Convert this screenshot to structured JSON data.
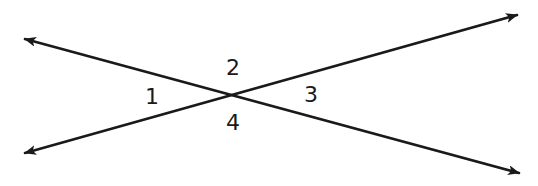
{
  "diagram": {
    "type": "intersecting-lines",
    "colors": {
      "background": "#ffffff",
      "stroke": "#1a1a1a"
    },
    "intersection": {
      "x": 233,
      "y": 94
    },
    "lines": [
      {
        "id": "line-a",
        "description": "upper-left to lower-right",
        "start": {
          "x": 25,
          "y": 39
        },
        "end": {
          "x": 519,
          "y": 173
        },
        "arrows": [
          "start",
          "end"
        ]
      },
      {
        "id": "line-b",
        "description": "lower-left to upper-right",
        "start": {
          "x": 25,
          "y": 153
        },
        "end": {
          "x": 517,
          "y": 15
        },
        "arrows": [
          "start",
          "end"
        ]
      }
    ],
    "angles": [
      {
        "label": "1",
        "position": "left",
        "x": 152,
        "y": 97
      },
      {
        "label": "2",
        "position": "top",
        "x": 233,
        "y": 68
      },
      {
        "label": "3",
        "position": "right",
        "x": 311,
        "y": 95
      },
      {
        "label": "4",
        "position": "bottom",
        "x": 233,
        "y": 123
      }
    ]
  }
}
